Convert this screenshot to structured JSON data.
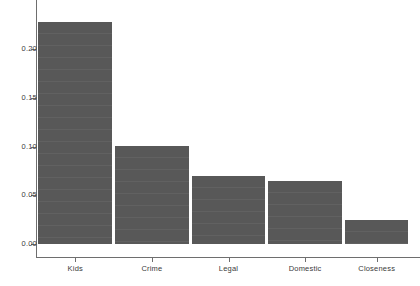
{
  "chart_data": {
    "type": "bar",
    "title": "",
    "subtitle": "",
    "xlabel": "",
    "ylabel": "",
    "categories": [
      "Kids",
      "Crime",
      "Legal",
      "Domestic",
      "Closeness"
    ],
    "values": [
      0.228,
      0.101,
      0.07,
      0.065,
      0.025
    ],
    "series": [
      {
        "name": "",
        "values": [
          0.228,
          0.101,
          0.07,
          0.065,
          0.025
        ]
      }
    ],
    "ylim": [
      0.0,
      0.238
    ],
    "xlim": [
      0,
      5
    ],
    "ytick_labels": [
      "0.00",
      "0.05",
      "0.10",
      "0.15",
      "0.20"
    ],
    "ytick_values": [
      0.0,
      0.05,
      0.1,
      0.15,
      0.2
    ],
    "grid": false,
    "legend": false,
    "legend_position": "none",
    "bar_color": "#585858",
    "axis_color": "#6e6e6e",
    "background_color": "#ffffff",
    "text_color": "#3a3a3a"
  },
  "axes": {
    "y_ticks": [
      {
        "label": "0.00",
        "value": 0.0
      },
      {
        "label": "0.05",
        "value": 0.05
      },
      {
        "label": "0.10",
        "value": 0.1
      },
      {
        "label": "0.15",
        "value": 0.15
      },
      {
        "label": "0.20",
        "value": 0.2
      }
    ],
    "x_ticks": [
      {
        "label": "Kids"
      },
      {
        "label": "Crime"
      },
      {
        "label": "Legal"
      },
      {
        "label": "Domestic"
      },
      {
        "label": "Closeness"
      }
    ]
  }
}
